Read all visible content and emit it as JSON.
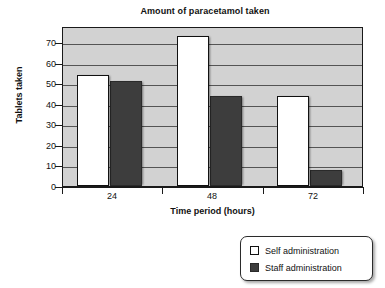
{
  "chart_data": {
    "type": "bar",
    "title": "Amount of paracetamol taken",
    "xlabel": "Time period (hours)",
    "ylabel": "Tablets taken",
    "categories": [
      "24",
      "48",
      "72"
    ],
    "series": [
      {
        "name": "Self administration",
        "values": [
          54,
          73,
          44
        ],
        "color": "#ffffff"
      },
      {
        "name": "Staff administration",
        "values": [
          51,
          44,
          8
        ],
        "color": "#3d3d3d"
      }
    ],
    "ylim": [
      0,
      78
    ],
    "yticks": [
      "0",
      "10",
      "20",
      "30",
      "40",
      "50",
      "60",
      "70"
    ],
    "ytick_values": [
      0,
      10,
      20,
      30,
      40,
      50,
      60,
      70
    ],
    "grid": true,
    "legend_position": "bottom-right",
    "plot_background": "#d2d2d2",
    "gridline_color": "#555555",
    "axis_color": "#1a1a1a"
  },
  "legend": {
    "items": [
      {
        "label": "Self administration",
        "swatch": "self"
      },
      {
        "label": "Staff administration",
        "swatch": "staff"
      }
    ]
  }
}
